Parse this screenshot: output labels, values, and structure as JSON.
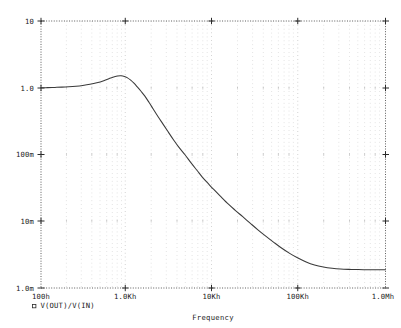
{
  "app": {
    "title": "Probe Waveform Plot"
  },
  "chart_data": {
    "type": "line",
    "title": "",
    "subtitle": "",
    "xlabel": "Frequency",
    "ylabel": "",
    "xscale": "log",
    "yscale": "log",
    "xlim": [
      100,
      1000000
    ],
    "ylim": [
      0.001,
      10
    ],
    "grid": true,
    "grid_style": "dotted",
    "legend_position": "bottom-left",
    "x_tick_labels": [
      "100h",
      "1.0Kh",
      "10Kh",
      "100Kh",
      "1.0Mh"
    ],
    "x_tick_values": [
      100,
      1000,
      10000,
      100000,
      1000000
    ],
    "y_tick_labels": [
      "10",
      "1.0",
      "100m",
      "10m",
      "1.0m"
    ],
    "y_tick_values": [
      10,
      1,
      0.1,
      0.01,
      0.001
    ],
    "series": [
      {
        "name": "V(OUT)/V(IN)",
        "marker": "square",
        "color": "#3a3a3a",
        "x": [
          100,
          120,
          145,
          175,
          210,
          255,
          305,
          370,
          445,
          535,
          645,
          700,
          775,
          850,
          930,
          1000,
          1100,
          1200,
          1320,
          1450,
          1600,
          1800,
          2000,
          2300,
          2600,
          3000,
          3500,
          4000,
          4700,
          5500,
          6500,
          7500,
          9000,
          10000,
          12000,
          15000,
          18000,
          22000,
          27000,
          33000,
          40000,
          50000,
          62000,
          78000,
          95000,
          120000,
          150000,
          190000,
          240000,
          300000,
          380000,
          480000,
          600000,
          750000,
          1000000
        ],
        "y": [
          1.0,
          1.005,
          1.012,
          1.022,
          1.036,
          1.056,
          1.083,
          1.125,
          1.185,
          1.275,
          1.4,
          1.45,
          1.5,
          1.51,
          1.48,
          1.42,
          1.3,
          1.17,
          1.02,
          0.885,
          0.755,
          0.6,
          0.485,
          0.365,
          0.288,
          0.218,
          0.162,
          0.128,
          0.099,
          0.0755,
          0.0575,
          0.0455,
          0.0352,
          0.0305,
          0.024,
          0.018,
          0.0146,
          0.0117,
          0.0093,
          0.00745,
          0.0061,
          0.00488,
          0.00397,
          0.00327,
          0.00283,
          0.00245,
          0.00221,
          0.00206,
          0.00197,
          0.00192,
          0.0019,
          0.00189,
          0.00188,
          0.00188,
          0.00188
        ]
      }
    ]
  },
  "legend": {
    "entries": [
      {
        "marker": "square-marker",
        "label": "V(OUT)/V(IN)"
      }
    ]
  },
  "axes": {
    "x_title": "Frequency",
    "y_title": ""
  }
}
